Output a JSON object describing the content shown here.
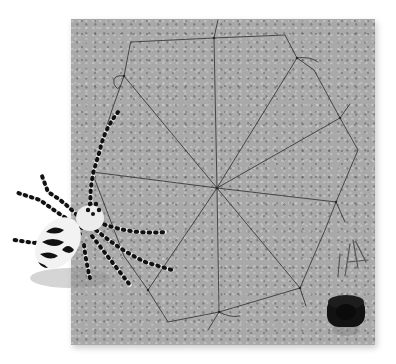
{
  "image": {
    "description": "Wire spider web on a grey corkboard with a beaded black-and-white spider, a few straight pins and a black spool of wire",
    "colors": {
      "background": "#ffffff",
      "board": "#a9a9a9",
      "wire": "#3a3a3a",
      "spool": "#111111",
      "spider_body": "#eeeeee",
      "spider_marks": "#111111"
    },
    "objects": [
      {
        "name": "corkboard",
        "bbox": [
          71,
          19,
          304,
          326
        ]
      },
      {
        "name": "wire-web",
        "center": [
          217,
          188
        ]
      },
      {
        "name": "beaded-spider",
        "bbox": [
          12,
          168,
          165,
          120
        ]
      },
      {
        "name": "pins",
        "bbox": [
          340,
          238,
          30,
          42
        ]
      },
      {
        "name": "wire-spool",
        "center": [
          345,
          318
        ]
      }
    ]
  }
}
